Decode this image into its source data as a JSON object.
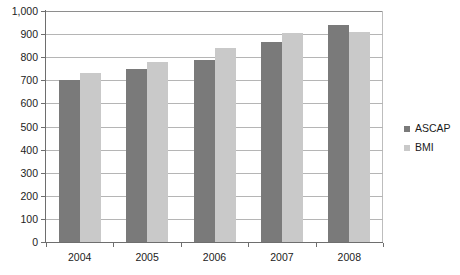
{
  "chart_data": {
    "type": "bar",
    "title": "",
    "subtitle": "",
    "xlabel": "",
    "ylabel": "",
    "categories": [
      "2004",
      "2005",
      "2006",
      "2007",
      "2008"
    ],
    "series": [
      {
        "name": "ASCAP",
        "color": "#7a7a7a",
        "values": [
          700,
          750,
          790,
          865,
          940
        ]
      },
      {
        "name": "BMI",
        "color": "#c9c9c9",
        "values": [
          730,
          780,
          840,
          905,
          910
        ]
      }
    ],
    "ylim": [
      0,
      1000
    ],
    "ytick_step": 100,
    "ytick_labels": [
      "0",
      "100",
      "200",
      "300",
      "400",
      "500",
      "600",
      "700",
      "800",
      "900",
      "1,000"
    ],
    "grid": true,
    "grid_axis": "y",
    "legend_position": "right",
    "background_color": "#ffffff",
    "axis_color": "#6e6e6e",
    "gridline_color": "#b5b5b5"
  },
  "legend": {
    "items": [
      {
        "label": "ASCAP",
        "swatch": "legend-swatch-ascap"
      },
      {
        "label": "BMI",
        "swatch": "legend-swatch-bmi"
      }
    ]
  }
}
